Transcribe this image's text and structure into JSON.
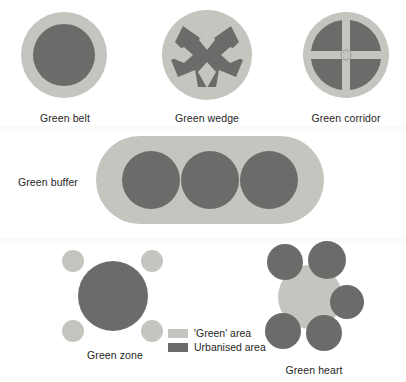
{
  "figure": {
    "background_color": "#ffffff",
    "colors": {
      "green_area": "#c3c5bf",
      "urbanised_area": "#6b6c6a"
    }
  },
  "diagrams": [
    {
      "key": "green_belt",
      "label": "Green belt",
      "description": "Single urbanised core surrounded by a continuous ring of green area",
      "label_x": 65,
      "label_y": 112
    },
    {
      "key": "green_wedge",
      "label": "Green wedge",
      "description": "Urbanised core with four diagonal lobes, green wedges penetrating from north, south, east and west",
      "label_x": 207,
      "label_y": 112
    },
    {
      "key": "green_corridor",
      "label": "Green corridor",
      "description": "Four urbanised quadrants separated by a cross of green corridors with a green node at the centre",
      "label_x": 346,
      "label_y": 112
    },
    {
      "key": "green_buffer",
      "label": "Green buffer",
      "description": "Three urbanised settlements embedded in a continuous stadium-shaped green buffer",
      "label_x": 18,
      "label_y": 176
    },
    {
      "key": "green_zone",
      "label": "Green zone",
      "description": "Large urbanised core with four small detached green zones at the corners",
      "label_x": 115,
      "label_y": 349
    },
    {
      "key": "green_heart",
      "label": "Green heart",
      "description": "Central green heart encircled by five urbanised settlements",
      "label_x": 314,
      "label_y": 364
    }
  ],
  "legend": {
    "items": [
      {
        "label": "'Green' area",
        "color": "#c3c5bf"
      },
      {
        "label": "Urbanised area",
        "color": "#6b6c6a"
      }
    ]
  }
}
